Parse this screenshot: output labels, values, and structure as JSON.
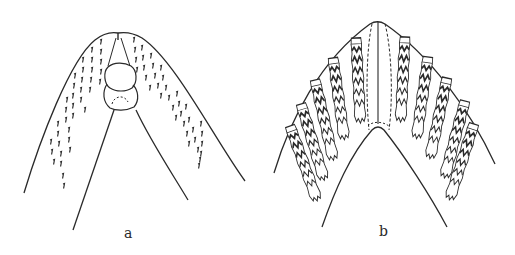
{
  "figure": {
    "panels": [
      {
        "id": "a",
        "label": "a",
        "description": "Mouthpart with scattered small hooked teeth in diagonal rows on both sides of a central oval structure"
      },
      {
        "id": "b",
        "label": "b",
        "description": "Mouthpart with two fan-like sets of five elongated zig-zag toothed plates on each side of a central dashed median field"
      }
    ],
    "colors": {
      "ink": "#2a2a2a",
      "background": "#ffffff"
    }
  }
}
